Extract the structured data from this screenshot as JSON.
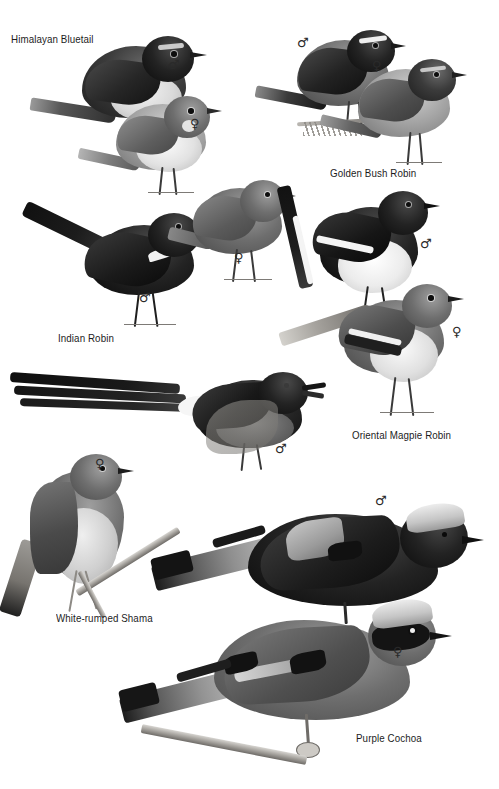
{
  "page": {
    "kind": "field-guide-plate",
    "background_color": "#ffffff",
    "width": 499,
    "height": 789,
    "ink_color": "#1c1c1c"
  },
  "symbols": {
    "male": "♂",
    "female": "♀"
  },
  "species": [
    {
      "id": "himalayan-bluetail",
      "name": "Himalayan Bluetail",
      "label": {
        "x": 11,
        "y": 33
      },
      "figures": [
        {
          "sex": "male",
          "symbol": "♂",
          "symbol_x": 168,
          "symbol_y": 58
        },
        {
          "sex": "female",
          "symbol": "♀",
          "symbol_x": 190,
          "symbol_y": 117
        }
      ]
    },
    {
      "id": "golden-bush-robin",
      "name": "Golden Bush Robin",
      "label": {
        "x": 330,
        "y": 167
      },
      "figures": [
        {
          "sex": "male",
          "symbol": "♂",
          "symbol_x": 297,
          "symbol_y": 36
        },
        {
          "sex": "female",
          "symbol": "♀",
          "symbol_x": 372,
          "symbol_y": 59
        }
      ]
    },
    {
      "id": "indian-robin",
      "name": "Indian Robin",
      "label": {
        "x": 58,
        "y": 332
      },
      "figures": [
        {
          "sex": "male",
          "symbol": "♂",
          "symbol_x": 139,
          "symbol_y": 291
        },
        {
          "sex": "female",
          "symbol": "♀",
          "symbol_x": 234,
          "symbol_y": 251
        }
      ]
    },
    {
      "id": "oriental-magpie-robin",
      "name": "Oriental Magpie Robin",
      "label": {
        "x": 352,
        "y": 429
      },
      "figures": [
        {
          "sex": "male",
          "symbol": "♂",
          "symbol_x": 420,
          "symbol_y": 237
        },
        {
          "sex": "female",
          "symbol": "♀",
          "symbol_x": 452,
          "symbol_y": 325
        }
      ]
    },
    {
      "id": "white-rumped-shama",
      "name": "White-rumped Shama",
      "label": {
        "x": 56,
        "y": 612
      },
      "figures": [
        {
          "sex": "male",
          "symbol": "♂",
          "symbol_x": 275,
          "symbol_y": 442
        },
        {
          "sex": "female",
          "symbol": "♀",
          "symbol_x": 95,
          "symbol_y": 457
        }
      ]
    },
    {
      "id": "purple-cochoa",
      "name": "Purple Cochoa",
      "label": {
        "x": 356,
        "y": 732
      },
      "figures": [
        {
          "sex": "male",
          "symbol": "♂",
          "symbol_x": 375,
          "symbol_y": 494
        },
        {
          "sex": "female",
          "symbol": "♀",
          "symbol_x": 393,
          "symbol_y": 645
        }
      ]
    }
  ]
}
